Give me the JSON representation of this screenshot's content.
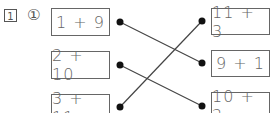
{
  "problem": {
    "number": "1",
    "sub_number": "①",
    "left_items": [
      "1 + 9",
      "2 + 10",
      "3 + 11"
    ],
    "right_items": [
      "11 + 3",
      "9 + 1",
      "10 + 2"
    ],
    "connections": [
      {
        "from": 0,
        "to": 1
      },
      {
        "from": 1,
        "to": 2
      },
      {
        "from": 2,
        "to": 0
      }
    ]
  }
}
